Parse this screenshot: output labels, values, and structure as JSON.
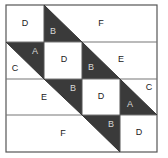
{
  "diagram": {
    "type": "quilt-block-piecing-diagram",
    "grid": {
      "rows": 4,
      "cols": 4
    },
    "colors": {
      "dark": "#3a3a3a",
      "light": "#ffffff",
      "line": "#555555",
      "text_dark": "#222222",
      "text_light": "#d8d8d8"
    },
    "pieces": [
      {
        "id": "r1-d",
        "label": "D",
        "shape": "square",
        "fill": "light"
      },
      {
        "id": "r1-b",
        "label": "B",
        "shape": "triangle",
        "fill": "dark"
      },
      {
        "id": "r1-f",
        "label": "F",
        "shape": "trapezoid",
        "fill": "light"
      },
      {
        "id": "r2-a",
        "label": "A",
        "shape": "triangle",
        "fill": "dark"
      },
      {
        "id": "r2-c",
        "label": "C",
        "shape": "triangle",
        "fill": "light"
      },
      {
        "id": "r2-d",
        "label": "D",
        "shape": "square",
        "fill": "light"
      },
      {
        "id": "r2-b",
        "label": "B",
        "shape": "triangle",
        "fill": "dark"
      },
      {
        "id": "r2-e",
        "label": "E",
        "shape": "trapezoid",
        "fill": "light"
      },
      {
        "id": "r3-e",
        "label": "E",
        "shape": "trapezoid",
        "fill": "light"
      },
      {
        "id": "r3-b",
        "label": "B",
        "shape": "triangle",
        "fill": "dark"
      },
      {
        "id": "r3-d",
        "label": "D",
        "shape": "square",
        "fill": "light"
      },
      {
        "id": "r3-a",
        "label": "A",
        "shape": "triangle",
        "fill": "dark"
      },
      {
        "id": "r3-c",
        "label": "C",
        "shape": "triangle",
        "fill": "light"
      },
      {
        "id": "r4-f",
        "label": "F",
        "shape": "trapezoid",
        "fill": "light"
      },
      {
        "id": "r4-b",
        "label": "B",
        "shape": "triangle",
        "fill": "dark"
      },
      {
        "id": "r4-d",
        "label": "D",
        "shape": "square",
        "fill": "light"
      }
    ]
  }
}
